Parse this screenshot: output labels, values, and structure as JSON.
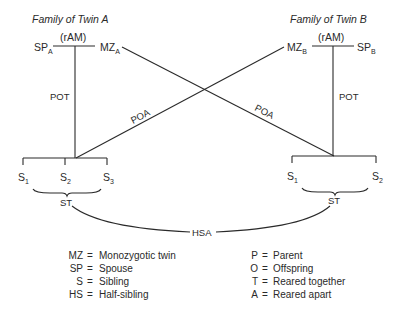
{
  "diagram": {
    "family_a": {
      "title": "Family of Twin A",
      "spouse": {
        "base": "SP",
        "sub": "A"
      },
      "twin": {
        "base": "MZ",
        "sub": "A"
      },
      "spouse_relation": "(rAM)",
      "parent_offspring_edge": "POT",
      "siblings": [
        {
          "base": "S",
          "sub": "1"
        },
        {
          "base": "S",
          "sub": "2"
        },
        {
          "base": "S",
          "sub": "3"
        }
      ],
      "sibship_label": "ST"
    },
    "family_b": {
      "title": "Family of Twin B",
      "spouse": {
        "base": "SP",
        "sub": "B"
      },
      "twin": {
        "base": "MZ",
        "sub": "B"
      },
      "spouse_relation": "(rAM)",
      "parent_offspring_edge": "POT",
      "siblings": [
        {
          "base": "S",
          "sub": "1"
        },
        {
          "base": "S",
          "sub": "2"
        }
      ],
      "sibship_label": "ST"
    },
    "cross_edges": {
      "a_to_b": "POA",
      "b_to_a": "POA"
    },
    "half_sib_edge": "HSA",
    "legend": {
      "left": [
        {
          "abbr": "MZ",
          "eq": "=",
          "meaning": "Monozygotic twin"
        },
        {
          "abbr": "SP",
          "eq": "=",
          "meaning": "Spouse"
        },
        {
          "abbr": "S",
          "eq": "=",
          "meaning": "Sibling"
        },
        {
          "abbr": "HS",
          "eq": "=",
          "meaning": "Half-sibling"
        }
      ],
      "right": [
        {
          "abbr": "P",
          "eq": "=",
          "meaning": "Parent"
        },
        {
          "abbr": "O",
          "eq": "=",
          "meaning": "Offspring"
        },
        {
          "abbr": "T",
          "eq": "=",
          "meaning": "Reared together"
        },
        {
          "abbr": "A",
          "eq": "=",
          "meaning": "Reared apart"
        }
      ]
    }
  }
}
